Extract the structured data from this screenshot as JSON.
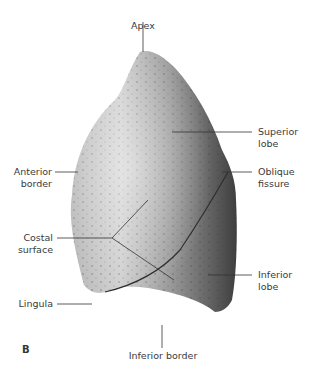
{
  "figure": {
    "panel_letter": "B",
    "colors": {
      "background": "#ffffff",
      "lung_light": "#d9d9d9",
      "lung_mid": "#a8a8a8",
      "lung_dark": "#4a4a4a",
      "leader_line": "#333333",
      "text": "#3a3a3a"
    }
  },
  "labels": {
    "apex": "Apex",
    "superior_lobe_1": "Superior",
    "superior_lobe_2": "lobe",
    "anterior_border_1": "Anterior",
    "anterior_border_2": "border",
    "oblique_fissure_1": "Oblique",
    "oblique_fissure_2": "fissure",
    "costal_surface_1": "Costal",
    "costal_surface_2": "surface",
    "inferior_lobe_1": "Inferior",
    "inferior_lobe_2": "lobe",
    "lingula": "Lingula",
    "inferior_border": "Inferior border"
  }
}
